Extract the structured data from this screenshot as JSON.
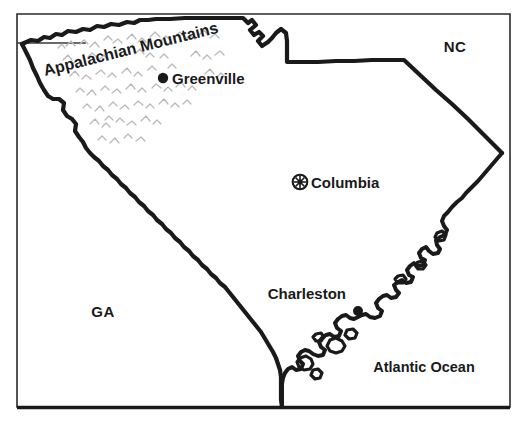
{
  "map": {
    "title": "South Carolina",
    "background_color": "#ffffff",
    "line_color": "#1a1a1a",
    "hachure_color": "#b9b9b9",
    "frame": {
      "left": 17,
      "top": 14,
      "right": 510,
      "bottom": 408,
      "name": "map-frame"
    },
    "graticule": {
      "label": "latitude-line",
      "y": 43,
      "x_start": 17,
      "x_end": 86
    },
    "cities": [
      {
        "name": "Greenville",
        "symbol": "filled-circle",
        "x": 163,
        "y": 78,
        "label_x": 172,
        "label_y": 84,
        "label_anchor": "start"
      },
      {
        "name": "Columbia",
        "symbol": "circled-star-capital",
        "x": 300,
        "y": 182,
        "label_x": 311,
        "label_y": 188,
        "label_anchor": "start"
      },
      {
        "name": "Charleston",
        "symbol": "filled-circle",
        "x": 358,
        "y": 311,
        "label_x": 346,
        "label_y": 299,
        "label_anchor": "end"
      }
    ],
    "region_labels": [
      {
        "name": "NC",
        "x": 455,
        "y": 52,
        "kind": "state-abbreviation"
      },
      {
        "name": "GA",
        "x": 103,
        "y": 317,
        "kind": "state-abbreviation"
      },
      {
        "name": "Atlantic Ocean",
        "x": 424,
        "y": 372,
        "kind": "ocean"
      }
    ],
    "physical_features": [
      {
        "name": "Appalachian Mountains",
        "kind": "mountain-range",
        "x": 45,
        "y": 76,
        "rotation_deg": -14,
        "texture": "gray-chevron-hachure"
      }
    ]
  }
}
